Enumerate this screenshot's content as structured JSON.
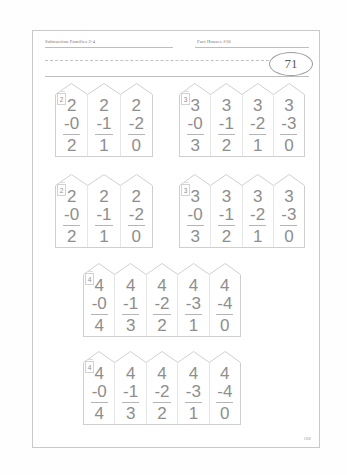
{
  "page": {
    "header_left": "Subtraction Families 2-4",
    "header_right": "Fact Houses #10",
    "page_badge": "71",
    "footer_page": "188",
    "colors": {
      "ink": "#8e8e8e",
      "rule": "#cfcfcf",
      "page_border": "#c9c9c9"
    }
  },
  "houses": [
    {
      "family": "2",
      "tag": "2",
      "columns": [
        {
          "minuend": "2",
          "subtrahend": "-0",
          "answer": "2"
        },
        {
          "minuend": "2",
          "subtrahend": "-1",
          "answer": "1"
        },
        {
          "minuend": "2",
          "subtrahend": "-2",
          "answer": "0"
        }
      ]
    },
    {
      "family": "3",
      "tag": "3",
      "columns": [
        {
          "minuend": "3",
          "subtrahend": "-0",
          "answer": "3"
        },
        {
          "minuend": "3",
          "subtrahend": "-1",
          "answer": "2"
        },
        {
          "minuend": "3",
          "subtrahend": "-2",
          "answer": "1"
        },
        {
          "minuend": "3",
          "subtrahend": "-3",
          "answer": "0"
        }
      ]
    },
    {
      "family": "2",
      "tag": "2",
      "columns": [
        {
          "minuend": "2",
          "subtrahend": "-0",
          "answer": "2"
        },
        {
          "minuend": "2",
          "subtrahend": "-1",
          "answer": "1"
        },
        {
          "minuend": "2",
          "subtrahend": "-2",
          "answer": "0"
        }
      ]
    },
    {
      "family": "3",
      "tag": "3",
      "columns": [
        {
          "minuend": "3",
          "subtrahend": "-0",
          "answer": "3"
        },
        {
          "minuend": "3",
          "subtrahend": "-1",
          "answer": "2"
        },
        {
          "minuend": "3",
          "subtrahend": "-2",
          "answer": "1"
        },
        {
          "minuend": "3",
          "subtrahend": "-3",
          "answer": "0"
        }
      ]
    },
    {
      "family": "4",
      "tag": "4",
      "columns": [
        {
          "minuend": "4",
          "subtrahend": "-0",
          "answer": "4"
        },
        {
          "minuend": "4",
          "subtrahend": "-1",
          "answer": "3"
        },
        {
          "minuend": "4",
          "subtrahend": "-2",
          "answer": "2"
        },
        {
          "minuend": "4",
          "subtrahend": "-3",
          "answer": "1"
        },
        {
          "minuend": "4",
          "subtrahend": "-4",
          "answer": "0"
        }
      ]
    },
    {
      "family": "4",
      "tag": "4",
      "columns": [
        {
          "minuend": "4",
          "subtrahend": "-0",
          "answer": "4"
        },
        {
          "minuend": "4",
          "subtrahend": "-1",
          "answer": "3"
        },
        {
          "minuend": "4",
          "subtrahend": "-2",
          "answer": "2"
        },
        {
          "minuend": "4",
          "subtrahend": "-3",
          "answer": "1"
        },
        {
          "minuend": "4",
          "subtrahend": "-4",
          "answer": "0"
        }
      ]
    }
  ],
  "layout": [
    {
      "left": 22,
      "top": 52,
      "width": 98,
      "body_height": 62,
      "roof_height": 12
    },
    {
      "left": 146,
      "top": 52,
      "width": 126,
      "body_height": 62,
      "roof_height": 12
    },
    {
      "left": 22,
      "top": 143,
      "width": 98,
      "body_height": 62,
      "roof_height": 12
    },
    {
      "left": 146,
      "top": 143,
      "width": 126,
      "body_height": 62,
      "roof_height": 12
    },
    {
      "left": 50,
      "top": 232,
      "width": 158,
      "body_height": 62,
      "roof_height": 12
    },
    {
      "left": 50,
      "top": 320,
      "width": 158,
      "body_height": 62,
      "roof_height": 12
    }
  ]
}
